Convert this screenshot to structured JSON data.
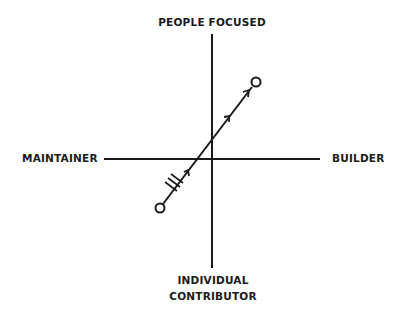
{
  "axes": {
    "top": "PEOPLE FOCUSED",
    "left": "MAINTAINER",
    "right": "BUILDER",
    "bottom_line1": "INDIVIDUAL",
    "bottom_line2": "CONTRIBUTOR"
  },
  "colors": {
    "stroke": "#1a1a1a",
    "background": "#ffffff"
  },
  "arrow": {
    "start": [
      160,
      208
    ],
    "end": [
      256,
      82
    ],
    "start_marker": "open-circle",
    "end_marker": "open-circle",
    "hatch_marks": 3,
    "mid_arrows": 3
  }
}
